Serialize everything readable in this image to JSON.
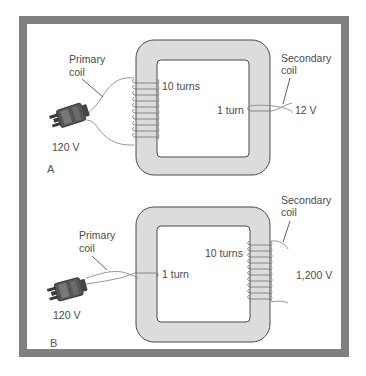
{
  "figure": {
    "frame_color": "#808080",
    "core_color": "#dcdcdc",
    "panels": [
      {
        "id": "A",
        "panel_label": "A",
        "primary": {
          "label_line1": "Primary",
          "label_line2": "coil",
          "turns_label": "10 turns",
          "voltage": "120 V"
        },
        "secondary": {
          "label_line1": "Secondary",
          "label_line2": "coil",
          "turns_label": "1 turn",
          "voltage": "12 V"
        }
      },
      {
        "id": "B",
        "panel_label": "B",
        "primary": {
          "label_line1": "Primary",
          "label_line2": "coil",
          "turns_label": "1 turn",
          "voltage": "120 V"
        },
        "secondary": {
          "label_line1": "Secondary",
          "label_line2": "coil",
          "turns_label": "10 turns",
          "voltage": "1,200 V"
        }
      }
    ]
  }
}
